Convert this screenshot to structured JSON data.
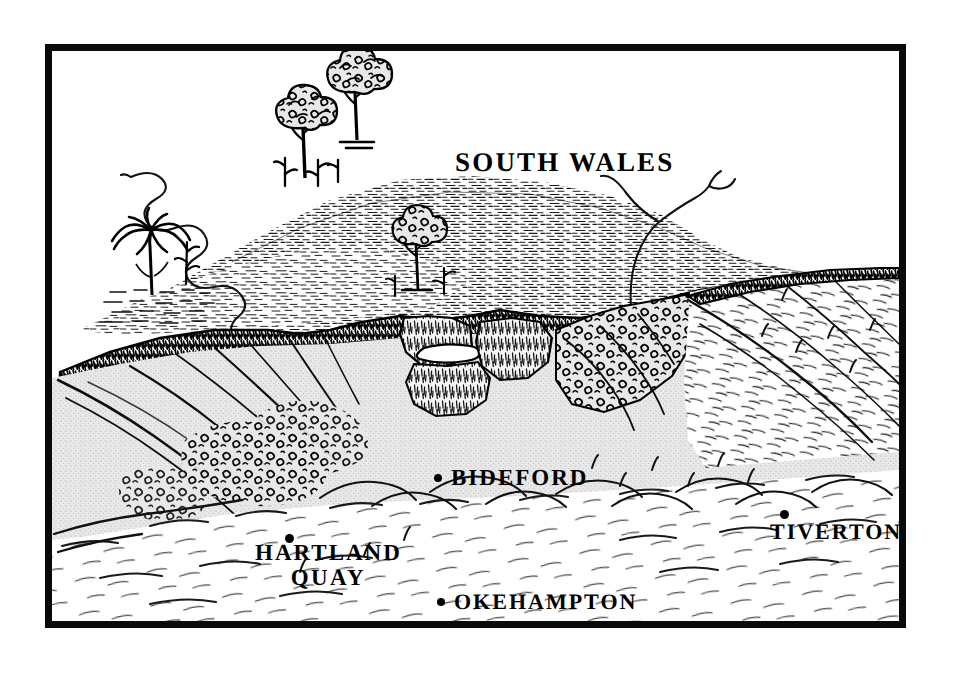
{
  "figure": {
    "type": "block-diagram",
    "frame": {
      "border_color": "#0a0a0a",
      "background": "#ffffff"
    }
  },
  "palette": {
    "ink": "#000000",
    "paper": "#ffffff",
    "shaded_land": "#e4e4e4",
    "shaded_land_dark": "#d2d2d2",
    "frame": "#0a0a0a"
  },
  "labels": {
    "south_wales": {
      "text": "SOUTH WALES",
      "has_dot": false
    },
    "bideford": {
      "text": "BIDEFORD",
      "has_dot": true,
      "dot_glyph": "•"
    },
    "tiverton": {
      "text": "TIVERTON",
      "has_dot": true,
      "dot_glyph": "•"
    },
    "okehampton": {
      "text": "OKEHAMPTON",
      "has_dot": true,
      "dot_glyph": "•"
    },
    "hartland_quay": {
      "line1": "HARTLAND",
      "line2": "QUAY",
      "has_dot": true,
      "dot_glyph": "•"
    }
  },
  "features": {
    "palm_tree": "palm-tree-icon",
    "broadleaf_tree_left": "tree-icon",
    "broadleaf_tree_right": "tree-icon",
    "broadleaf_tree_mid": "tree-icon",
    "meander_river": "river-icon",
    "branching_stream": "stream-icon",
    "escarpment": "cliff-icon",
    "gorge": "valley-icon",
    "plateau": "upland-icon",
    "foreground_plain": "lowland-icon"
  }
}
